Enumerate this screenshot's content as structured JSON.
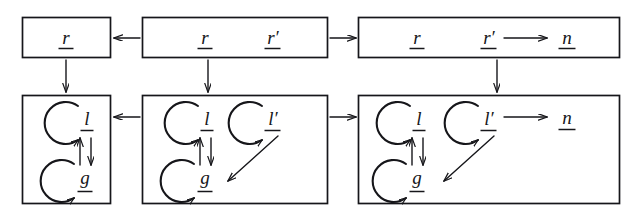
{
  "figure": {
    "type": "commutative-diagram",
    "stroke_color": "#16161a",
    "background_color": "#ffffff"
  },
  "labels": {
    "r": "r",
    "r_prime": "r′",
    "n": "n",
    "l": "l",
    "l_prime": "l′",
    "g": "g"
  },
  "boxes": {
    "top_left": {
      "name": "top-left-box",
      "items": [
        "r"
      ]
    },
    "top_middle": {
      "name": "top-middle-box",
      "items": [
        "r",
        "r′"
      ]
    },
    "top_right": {
      "name": "top-right-box",
      "items": [
        "r",
        "r′",
        "n"
      ]
    },
    "bottom_left": {
      "name": "bottom-left-box",
      "items": [
        "l",
        "g"
      ]
    },
    "bottom_middle": {
      "name": "bottom-middle-box",
      "items": [
        "l",
        "l′",
        "g"
      ]
    },
    "bottom_right": {
      "name": "bottom-right-box",
      "items": [
        "l",
        "l′",
        "g",
        "n"
      ]
    }
  },
  "arrows": {
    "top_middle_to_top_left": "←",
    "top_middle_to_top_right": "→",
    "bottom_middle_to_bottom_left": "←",
    "bottom_middle_to_bottom_right": "→",
    "top_left_down": "↓",
    "top_middle_down": "↓",
    "top_right_down": "↓",
    "r_prime_to_n": "⟶",
    "l_prime_to_n": "⟶",
    "g_to_l": "↑",
    "l_to_g": "↓",
    "l_prime_to_g": "↘",
    "self_loop_l": "↺",
    "self_loop_g": "↺",
    "self_loop_l_prime": "↺"
  }
}
